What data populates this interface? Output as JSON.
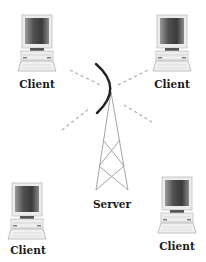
{
  "diagram": {
    "type": "client-server wireless network",
    "server": {
      "label": "Server",
      "icon": "radio-tower-icon"
    },
    "clients": [
      {
        "id": "top-left",
        "label": "Client",
        "icon": "desktop-computer-icon"
      },
      {
        "id": "top-right",
        "label": "Client",
        "icon": "desktop-computer-icon"
      },
      {
        "id": "bottom-left",
        "label": "Client",
        "icon": "desktop-computer-icon"
      },
      {
        "id": "bottom-right",
        "label": "Client",
        "icon": "desktop-computer-icon"
      }
    ],
    "connections": "dashed wireless signal lines from server antenna toward each client"
  },
  "colors": {
    "text": "#1a1a1a",
    "antenna_arc": "#222222",
    "tower": "#999999",
    "dashes": "#aaaaaa",
    "monitor_frame": "#d8d8d8",
    "screen_dark": "#3a3a3a",
    "screen_light": "#c8c8c8"
  }
}
